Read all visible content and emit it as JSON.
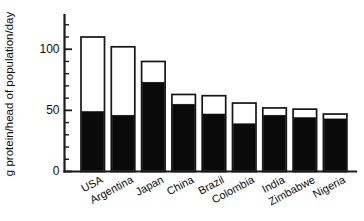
{
  "chart_data": {
    "type": "bar",
    "title": "",
    "subtitle": "",
    "xlabel": "",
    "ylabel": "g protein/head of population/day",
    "ylim": [
      0,
      128
    ],
    "yticks_major": [
      0,
      50,
      100
    ],
    "ytick_labels": [
      "0",
      "50",
      "100"
    ],
    "yticks_minor": [
      10,
      20,
      30,
      40,
      60,
      70,
      80,
      90,
      110,
      120
    ],
    "grid": false,
    "legend": false,
    "legend_position": "none",
    "stacked": true,
    "categories": [
      "USA",
      "Argentina",
      "Japan",
      "China",
      "Brazil",
      "Colombia",
      "India",
      "Zimbabwe",
      "Nigeria"
    ],
    "series": [
      {
        "name": "animal protein",
        "color": "#0a0a0a",
        "values": [
          49,
          46,
          73,
          55,
          47,
          39,
          46,
          44,
          43
        ]
      },
      {
        "name": "remainder of total protein",
        "color": "#ffffff",
        "values": [
          61,
          56,
          17,
          8,
          15,
          17,
          6,
          7,
          4
        ]
      }
    ],
    "totals": [
      110,
      102,
      90,
      63,
      62,
      56,
      52,
      51,
      47
    ]
  },
  "axis": {
    "y_title": "g protein/head of population/day"
  }
}
